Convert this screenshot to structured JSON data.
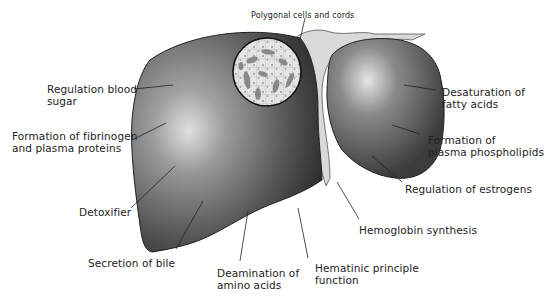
{
  "figure": {
    "colors": {
      "ink": "#222222",
      "organ_dark": "#3a3a3a",
      "organ_mid": "#6e6e6e",
      "organ_light": "#d8d8d8",
      "background": "#ffffff"
    }
  },
  "labels": {
    "polygonal": "Polygonal cells and cords",
    "blood_sugar": "Regulation blood\nsugar",
    "fibrinogen": "Formation of fibrinogen\nand plasma proteins",
    "detoxifier": "Detoxifier",
    "bile": "Secretion of bile",
    "deamination": "Deamination of\namino acids",
    "hematinic": "Hematinic principle\nfunction",
    "hemoglobin": "Hemoglobin synthesis",
    "estrogens": "Regulation of estrogens",
    "phospholipids": "Formation of\nplasma phospholipids",
    "fatty_acids": "Desaturation of\nfatty acids"
  }
}
